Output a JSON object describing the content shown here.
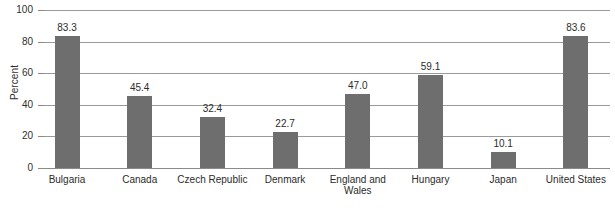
{
  "chart_data": {
    "type": "bar",
    "title": "",
    "subtitle": "",
    "xlabel": "",
    "ylabel": "Percent",
    "ylim": [
      0,
      100
    ],
    "yticks": [
      0,
      20,
      40,
      60,
      80,
      100
    ],
    "ytick_labels": [
      "0",
      "20",
      "40",
      "60",
      "80",
      "100"
    ],
    "grid": "horizontal",
    "legend": "none",
    "orientation": "vertical",
    "bar_color": "#6e6e6e",
    "gridline_color": "#9a9a9a",
    "background_color": "#ffffff",
    "categories": [
      "Bulgaria",
      "Canada",
      "Czech Republic",
      "Denmark",
      "England and\nWales",
      "Hungary",
      "Japan",
      "United States"
    ],
    "values": [
      83.3,
      45.4,
      32.4,
      22.7,
      47.0,
      59.1,
      10.1,
      83.6
    ],
    "value_labels": [
      "83.3",
      "45.4",
      "32.4",
      "22.7",
      "47.0",
      "59.1",
      "10.1",
      "83.6"
    ]
  }
}
